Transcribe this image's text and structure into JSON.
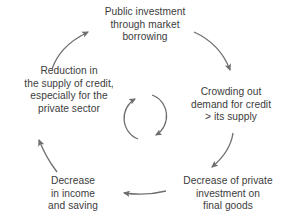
{
  "diagram": {
    "type": "cycle",
    "title": "",
    "direction": "clockwise",
    "text_color": "#3c3c3c",
    "arrow_color": "#6e6e6e",
    "background": "#ffffff",
    "center_icon": "circular-arrows-icon",
    "nodes": [
      {
        "id": "public-investment",
        "position": "top",
        "lines": [
          "Public investment",
          "through market",
          "borrowing"
        ]
      },
      {
        "id": "crowding-out",
        "position": "right",
        "lines": [
          "Crowding out",
          "demand for credit",
          "> its supply"
        ]
      },
      {
        "id": "decrease-private-investment",
        "position": "bottom-right",
        "lines": [
          "Decrease of private",
          "investment on",
          "final goods"
        ]
      },
      {
        "id": "decrease-income",
        "position": "bottom-left",
        "lines": [
          "Decrease",
          "in income",
          "and saving"
        ]
      },
      {
        "id": "reduction-supply-credit",
        "position": "left",
        "lines": [
          "Reduction in",
          "the supply of credit,",
          "especially for the",
          "private sector"
        ]
      }
    ],
    "edges": [
      {
        "id": "edge-public-to-crowding",
        "from": "public-investment",
        "to": "crowding-out"
      },
      {
        "id": "edge-crowding-to-decpriv",
        "from": "crowding-out",
        "to": "decrease-private-investment"
      },
      {
        "id": "edge-decpriv-to-decincome",
        "from": "decrease-private-investment",
        "to": "decrease-income"
      },
      {
        "id": "edge-decincome-to-reduct",
        "from": "decrease-income",
        "to": "reduction-supply-credit"
      },
      {
        "id": "edge-reduct-to-public",
        "from": "reduction-supply-credit",
        "to": "public-investment"
      }
    ]
  }
}
